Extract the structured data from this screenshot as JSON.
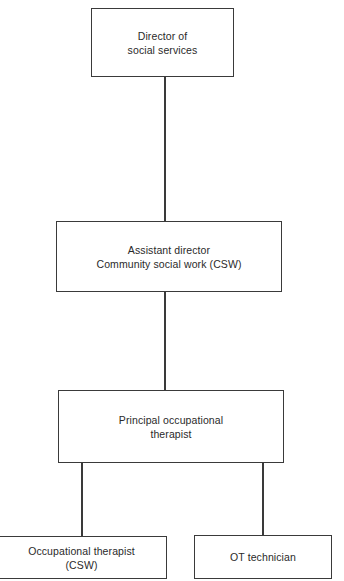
{
  "diagram": {
    "type": "organizational-chart",
    "nodes": [
      {
        "id": "director",
        "lines": [
          "Director of",
          "social services"
        ]
      },
      {
        "id": "assistant",
        "lines": [
          "Assistant director",
          "Community social work (CSW)"
        ]
      },
      {
        "id": "principal",
        "lines": [
          "Principal occupational",
          "therapist"
        ]
      },
      {
        "id": "ot",
        "lines": [
          "Occupational therapist",
          "(CSW)"
        ]
      },
      {
        "id": "tech",
        "lines": [
          "OT technician"
        ]
      }
    ],
    "edges": [
      {
        "from": "director",
        "to": "assistant"
      },
      {
        "from": "assistant",
        "to": "principal"
      },
      {
        "from": "principal",
        "to": "ot"
      },
      {
        "from": "principal",
        "to": "tech"
      }
    ],
    "colors": {
      "line": "#3a3a3a",
      "text": "#2a2a2a",
      "background": "#ffffff"
    }
  }
}
